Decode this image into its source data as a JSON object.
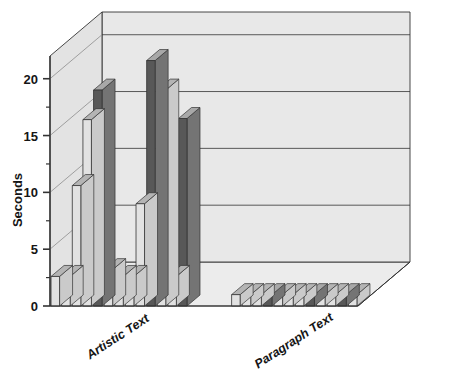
{
  "chart_data": {
    "type": "bar",
    "title": "",
    "subtitle": "",
    "xlabel": "",
    "ylabel": "Seconds",
    "ylim": [
      0,
      22
    ],
    "yticks": [
      0,
      5,
      10,
      15,
      20
    ],
    "ytick_labels": [
      "0",
      "5",
      "10",
      "15",
      "20"
    ],
    "minor_yticks": [
      2.5,
      7.5,
      12.5,
      17.5
    ],
    "grid": true,
    "grid_axis": "y",
    "legend": "none",
    "projection": "3d",
    "categories": [
      "Artistic Text",
      "Paragraph Text"
    ],
    "series_colors": {
      "light": "#e2e2e2",
      "dark": "#585858"
    },
    "groups": [
      {
        "name": "Artistic Text",
        "bars": [
          {
            "index": 1,
            "value": 2.6,
            "shade": "light"
          },
          {
            "index": 2,
            "value": 2.6,
            "shade": "light"
          },
          {
            "index": 3,
            "value": 10.6,
            "shade": "light"
          },
          {
            "index": 4,
            "value": 16.4,
            "shade": "light"
          },
          {
            "index": 5,
            "value": 19.0,
            "shade": "dark"
          },
          {
            "index": 6,
            "value": 3.2,
            "shade": "light"
          },
          {
            "index": 7,
            "value": 2.6,
            "shade": "light"
          },
          {
            "index": 8,
            "value": 2.6,
            "shade": "light"
          },
          {
            "index": 9,
            "value": 9.0,
            "shade": "light"
          },
          {
            "index": 10,
            "value": 21.6,
            "shade": "dark"
          },
          {
            "index": 11,
            "value": 19.0,
            "shade": "light"
          },
          {
            "index": 12,
            "value": 2.6,
            "shade": "light"
          },
          {
            "index": 13,
            "value": 16.5,
            "shade": "dark"
          }
        ]
      },
      {
        "name": "Paragraph Text",
        "bars": [
          {
            "index": 1,
            "value": 1.0,
            "shade": "light"
          },
          {
            "index": 2,
            "value": 1.0,
            "shade": "light"
          },
          {
            "index": 3,
            "value": 1.0,
            "shade": "light"
          },
          {
            "index": 4,
            "value": 1.0,
            "shade": "dark"
          },
          {
            "index": 5,
            "value": 1.0,
            "shade": "light"
          },
          {
            "index": 6,
            "value": 1.0,
            "shade": "light"
          },
          {
            "index": 7,
            "value": 1.0,
            "shade": "light"
          },
          {
            "index": 8,
            "value": 1.0,
            "shade": "dark"
          },
          {
            "index": 9,
            "value": 1.0,
            "shade": "light"
          },
          {
            "index": 10,
            "value": 1.0,
            "shade": "light"
          },
          {
            "index": 11,
            "value": 1.0,
            "shade": "dark"
          },
          {
            "index": 12,
            "value": 1.0,
            "shade": "light"
          }
        ]
      }
    ]
  },
  "axes": {
    "y_title": "Seconds",
    "y_tick_0": "0",
    "y_tick_5": "5",
    "y_tick_10": "10",
    "y_tick_15": "15",
    "y_tick_20": "20"
  },
  "labels": {
    "category_1": "Artistic Text",
    "category_2": "Paragraph Text"
  },
  "colors": {
    "bar_light": "#e2e2e2",
    "bar_light_top": "#b4b4b4",
    "bar_light_side": "#cacaca",
    "bar_dark": "#585858",
    "bar_dark_top": "#a8a8a8",
    "bar_dark_side": "#747474",
    "wall_back": "#e8e8e8",
    "wall_left": "#e3e3e3",
    "floor": "#ececec",
    "outline": "#333333",
    "text": "#151515"
  }
}
